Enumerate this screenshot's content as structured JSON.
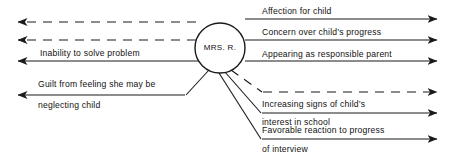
{
  "diagram": {
    "type": "force-field-diagram",
    "title": "",
    "center": {
      "label": "MRS.  R.",
      "shape": "circle",
      "cx": 220,
      "cy": 48,
      "r": 25
    },
    "colors": {
      "stroke": "#1a1a1a",
      "text": "#111111",
      "background": "#ffffff"
    },
    "driving_forces": [
      {
        "id": "affection-for-child",
        "label": "Affection for child",
        "direction": "right",
        "line_style": "solid",
        "label_x": 262,
        "label_y": 6,
        "line_y": 19,
        "line_x1": 245,
        "line_x2": 437
      },
      {
        "id": "concern-over-childs-progress",
        "label": "Concern over child’s progress",
        "direction": "right",
        "line_style": "solid",
        "label_x": 262,
        "label_y": 27,
        "line_y": 40,
        "line_x1": 245,
        "line_x2": 437
      },
      {
        "id": "appearing-as-responsible-parent",
        "label": "Appearing as responsible parent",
        "direction": "right",
        "line_style": "solid",
        "label_x": 262,
        "label_y": 49,
        "line_y": 61,
        "line_x1": 245,
        "line_x2": 437
      },
      {
        "id": "unlabeled-dashed-right",
        "label": "",
        "direction": "right",
        "line_style": "dashed",
        "label_x": 262,
        "label_y": 80,
        "line_y": 92,
        "line_x1": 262,
        "line_x2": 437
      },
      {
        "id": "increasing-signs-of-childs-interest-in-school",
        "label": "Increasing signs of child’s",
        "label_line2": "interest in school",
        "direction": "right",
        "line_style": "solid",
        "label_x": 262,
        "label_y": 99,
        "label2_x": 262,
        "label2_y": 117,
        "line_y": 113,
        "line_x1": 262,
        "line_x2": 437
      },
      {
        "id": "favorable-reaction-to-progress-of-interview",
        "label": "Favorable reaction to progress",
        "label_line2": "of interview",
        "direction": "right",
        "line_style": "solid",
        "label_x": 262,
        "label_y": 125,
        "label2_x": 262,
        "label2_y": 144,
        "line_y": 139,
        "line_x1": 262,
        "line_x2": 437
      }
    ],
    "restraining_forces": [
      {
        "id": "unlabeled-dashed-left-upper",
        "label": "",
        "direction": "left",
        "line_style": "dashed",
        "line_y": 22,
        "line_x1": 195,
        "line_x2": 18
      },
      {
        "id": "unlabeled-dashed-left-lower",
        "label": "",
        "direction": "left",
        "line_style": "dashed",
        "line_y": 40,
        "line_x1": 195,
        "line_x2": 18
      },
      {
        "id": "inability-to-solve-problem",
        "label": "Inability to solve problem",
        "direction": "left",
        "line_style": "solid",
        "label_x": 40,
        "label_y": 48,
        "line_y": 61,
        "line_x1": 195,
        "line_x2": 18
      },
      {
        "id": "guilt-from-feeling-she-may-be-neglecting-child",
        "label": "Guilt from feeling she may be",
        "label_line2": "neglecting child",
        "direction": "left",
        "line_style": "solid",
        "label_x": 38,
        "label_y": 79,
        "label2_x": 38,
        "label2_y": 100,
        "line_y": 95,
        "line_x1": 185,
        "line_x2": 18
      }
    ],
    "connectors": [
      {
        "id": "connector-guilt",
        "from": "circle-bottom-left",
        "to": "guilt-line"
      },
      {
        "id": "connector-dashed-right",
        "from": "circle-bottom",
        "to": "dashed-right-line",
        "line_style": "dashed"
      },
      {
        "id": "connector-increasing-signs",
        "from": "circle-bottom",
        "to": "increasing-signs-line"
      },
      {
        "id": "connector-favorable-reaction",
        "from": "circle-bottom",
        "to": "favorable-reaction-line"
      }
    ]
  }
}
